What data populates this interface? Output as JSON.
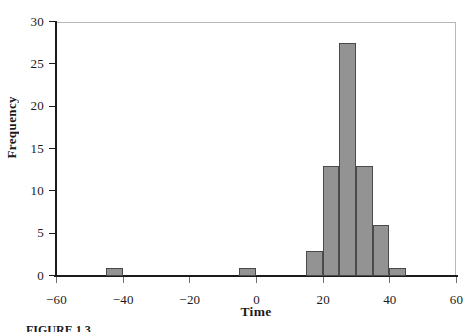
{
  "figure": {
    "caption": "FIGURE 1.3"
  },
  "axes": {
    "x_title": "Time",
    "y_title": "Frequency",
    "x_ticks": [
      "−60",
      "−40",
      "−20",
      "0",
      "20",
      "40",
      "60"
    ],
    "y_ticks": [
      "0",
      "5",
      "10",
      "15",
      "20",
      "25",
      "30"
    ]
  },
  "colors": {
    "bar_fill": "#939393",
    "bar_edge": "#4a4a4a",
    "axis": "#1b1b1b",
    "frame": "#b9b9b9"
  },
  "chart_data": {
    "type": "bar",
    "title": "",
    "subtitle": "",
    "xlabel": "Time",
    "ylabel": "Frequency",
    "xlim": [
      -60,
      60
    ],
    "ylim": [
      0,
      30
    ],
    "xtick_values": [
      -60,
      -40,
      -20,
      0,
      20,
      40,
      60
    ],
    "ytick_values": [
      0,
      5,
      10,
      15,
      20,
      25,
      30
    ],
    "grid": false,
    "legend": null,
    "bin_width": 5,
    "bins": [
      {
        "left": -45,
        "right": -40,
        "value": 1
      },
      {
        "left": -5,
        "right": 0,
        "value": 1
      },
      {
        "left": 15,
        "right": 20,
        "value": 3
      },
      {
        "left": 20,
        "right": 25,
        "value": 13
      },
      {
        "left": 25,
        "right": 30,
        "value": 27.5
      },
      {
        "left": 30,
        "right": 35,
        "value": 13
      },
      {
        "left": 35,
        "right": 40,
        "value": 6
      },
      {
        "left": 40,
        "right": 45,
        "value": 1
      }
    ],
    "categories": [
      "-45 to -40",
      "-5 to 0",
      "15 to 20",
      "20 to 25",
      "25 to 30",
      "30 to 35",
      "35 to 40",
      "40 to 45"
    ],
    "values": [
      1,
      1,
      3,
      13,
      27.5,
      13,
      6,
      1
    ]
  }
}
